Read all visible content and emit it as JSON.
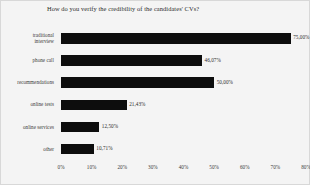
{
  "chart_data": {
    "type": "bar",
    "orientation": "horizontal",
    "title": "How do you verify the credibility of the candidates' CVs?",
    "xlabel": "",
    "ylabel": "",
    "xlim": [
      0,
      80
    ],
    "grid": false,
    "legend": "none",
    "bar_color": "#0d0d0d",
    "background_color": "#f4f4f4",
    "categories": [
      "traditional interview",
      "phone call",
      "recommendations",
      "online tests",
      "online services",
      "other"
    ],
    "category_lines": [
      [
        "traditional",
        "interview"
      ],
      [
        "phone call"
      ],
      [
        "recommendations"
      ],
      [
        "online tests"
      ],
      [
        "online services"
      ],
      [
        "other"
      ]
    ],
    "values": [
      75.0,
      46.07,
      50.0,
      21.43,
      12.5,
      10.71
    ],
    "value_labels": [
      "75,00%",
      "46,07%",
      "50,00%",
      "21,43%",
      "12,50%",
      "10,71%"
    ],
    "xticks": [
      0,
      10,
      20,
      30,
      40,
      50,
      60,
      70,
      80
    ],
    "xtick_labels": [
      "0%",
      "10%",
      "20%",
      "30%",
      "40%",
      "50%",
      "60%",
      "70%",
      "80%"
    ]
  }
}
